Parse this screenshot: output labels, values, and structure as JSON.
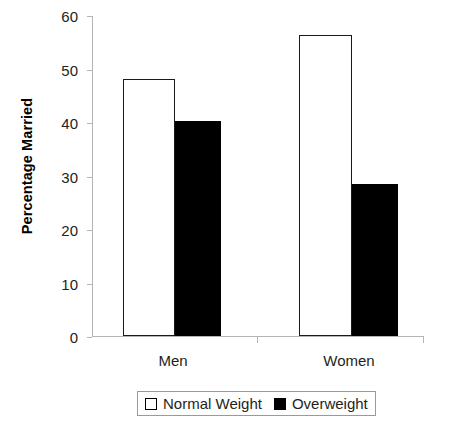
{
  "chart_data": {
    "type": "bar",
    "title": "",
    "subtitle": "",
    "xlabel": "",
    "ylabel": "Percentage Married",
    "categories": [
      "Men",
      "Women"
    ],
    "series": [
      {
        "name": "Normal Weight",
        "values": [
          48,
          56.2
        ],
        "color": "#ffffff",
        "edge_color": "#000000"
      },
      {
        "name": "Overweight",
        "values": [
          40.2,
          28.4
        ],
        "color": "#000000",
        "edge_color": "#000000"
      }
    ],
    "ylim": [
      0,
      60
    ],
    "yticks": [
      0,
      10,
      20,
      30,
      40,
      50,
      60
    ],
    "ytick_labels": [
      "0",
      "10",
      "20",
      "30",
      "40",
      "50",
      "60"
    ],
    "xtick_labels": [
      "Men",
      "Women"
    ],
    "grid": false,
    "legend": {
      "position": "below-axes",
      "entries": [
        {
          "label": "Normal Weight",
          "marker": "open-square-swatch"
        },
        {
          "label": "Overweight",
          "marker": "filled-square-swatch"
        }
      ]
    }
  }
}
